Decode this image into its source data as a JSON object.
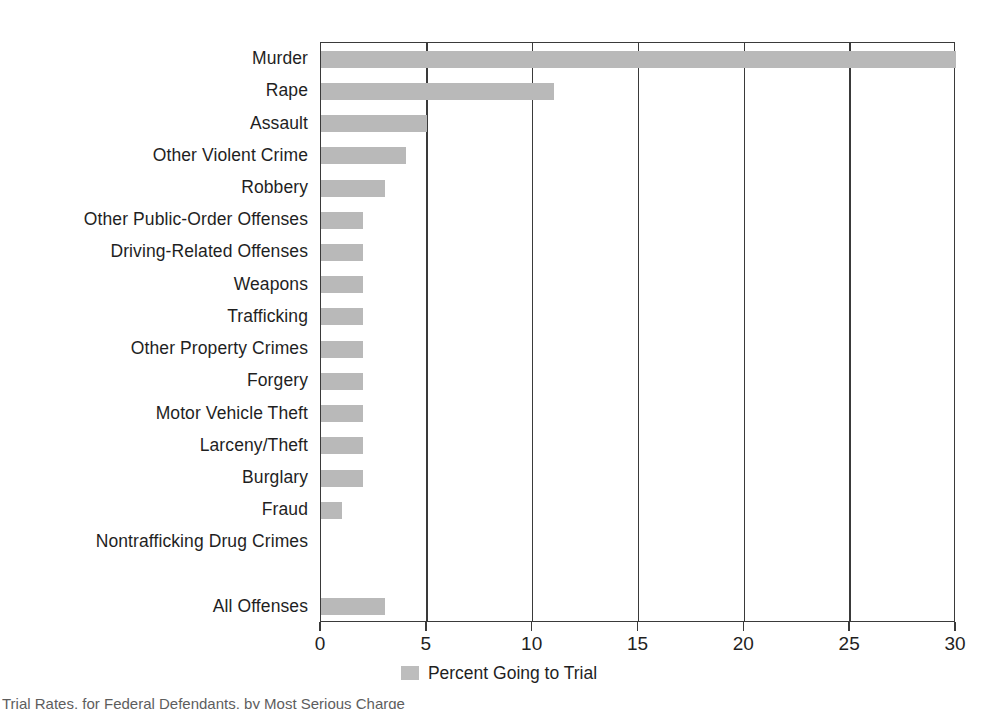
{
  "chart_data": {
    "type": "bar",
    "orientation": "horizontal",
    "title": "",
    "xlabel": "",
    "ylabel": "",
    "xlim": [
      0,
      30
    ],
    "xticks": [
      0,
      5,
      10,
      15,
      20,
      25,
      30
    ],
    "xticklabels": [
      "0",
      "5",
      "10",
      "15",
      "20",
      "25",
      "30"
    ],
    "grid": "vertical-gridlines-at-xticks",
    "legend": {
      "position": "bottom-center",
      "entries": [
        {
          "label": "Percent Going to Trial",
          "color": "#bdbdbd",
          "swatch": "legend-swatch"
        }
      ]
    },
    "series": [
      {
        "name": "Percent Going to Trial",
        "color": "#b9b9b9",
        "values": [
          30,
          11,
          5,
          4,
          3,
          2,
          2,
          2,
          2,
          2,
          2,
          2,
          2,
          2,
          1,
          0,
          null,
          3
        ]
      }
    ],
    "categories": [
      "Murder",
      "Rape",
      "Assault",
      "Other Violent Crime",
      "Robbery",
      "Other Public-Order Offenses",
      "Driving-Related Offenses",
      "Weapons",
      "Trafficking",
      "Other Property Crimes",
      "Forgery",
      "Motor Vehicle Theft",
      "Larceny/Theft",
      "Burglary",
      "Fraud",
      "Nontrafficking Drug Crimes",
      "",
      "All Offenses"
    ],
    "bars": [
      {
        "category": "Murder",
        "value": 30
      },
      {
        "category": "Rape",
        "value": 11
      },
      {
        "category": "Assault",
        "value": 5
      },
      {
        "category": "Other Violent Crime",
        "value": 4
      },
      {
        "category": "Robbery",
        "value": 3
      },
      {
        "category": "Other Public-Order Offenses",
        "value": 2
      },
      {
        "category": "Driving-Related Offenses",
        "value": 2
      },
      {
        "category": "Weapons",
        "value": 2
      },
      {
        "category": "Trafficking",
        "value": 2
      },
      {
        "category": "Other Property Crimes",
        "value": 2
      },
      {
        "category": "Forgery",
        "value": 2
      },
      {
        "category": "Motor Vehicle Theft",
        "value": 2
      },
      {
        "category": "Larceny/Theft",
        "value": 2
      },
      {
        "category": "Burglary",
        "value": 2
      },
      {
        "category": "Fraud",
        "value": 1
      },
      {
        "category": "Nontrafficking Drug Crimes",
        "value": 0
      },
      {
        "category": "",
        "value": null
      },
      {
        "category": "All Offenses",
        "value": 3
      }
    ]
  },
  "legend": {
    "label": "Percent Going to Trial"
  },
  "caption": {
    "text": "Trial Rates, for Federal Defendants, by Most Serious Charge"
  },
  "colors": {
    "bar": "#b9b9b9",
    "axis": "#3a3a3a",
    "text": "#1f1f1f",
    "background": "#ffffff"
  }
}
